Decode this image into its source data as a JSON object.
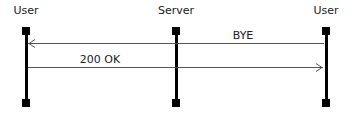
{
  "diagram": {
    "type": "sequence",
    "colors": {
      "lifeline": "#000000",
      "message": "#555555",
      "text": "#222222",
      "background": "#ffffff"
    },
    "actors": [
      {
        "label": "User",
        "x": 26
      },
      {
        "label": "Server",
        "x": 176
      },
      {
        "label": "User",
        "x": 326
      }
    ],
    "messages": [
      {
        "label": "BYE",
        "from": 2,
        "to": 0,
        "y": 43,
        "label_x": 243
      },
      {
        "label": "200 OK",
        "from": 0,
        "to": 2,
        "y": 67,
        "label_x": 100
      }
    ]
  }
}
